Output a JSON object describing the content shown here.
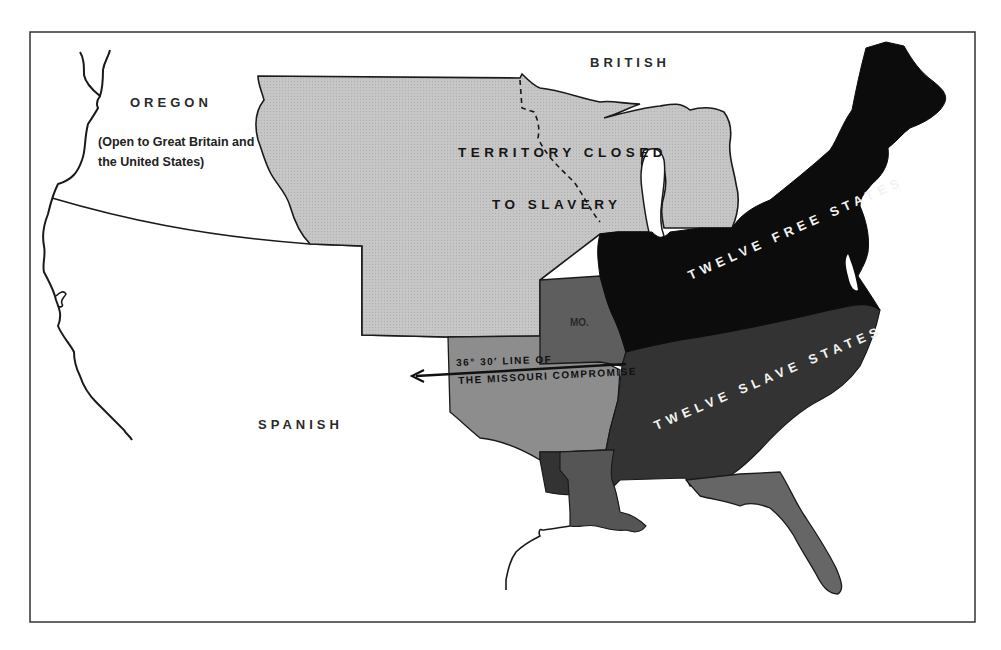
{
  "map": {
    "title": "Missouri Compromise map",
    "frame": {
      "x": 30,
      "y": 32,
      "width": 945,
      "height": 590
    },
    "colors": {
      "background": "#ffffff",
      "outline": "#1a1a1a",
      "closed_territory": "#c4c4c4",
      "missouri_and_slave_territory": "#6e6e6e",
      "slave_states": "#3a3a3a",
      "free_states": "#0c0c0c",
      "florida": "#6a6a6a"
    },
    "labels": {
      "british": "BRITISH",
      "oregon": "OREGON",
      "oregon_note": "(Open to Great Britain and the United States)",
      "spanish": "SPANISH",
      "territory_closed_line1": "TERRITORY CLOSED",
      "territory_closed_line2": "TO SLAVERY",
      "missouri": "MO.",
      "compromise_line1": "36° 30′ LINE OF",
      "compromise_line2": "THE MISSOURI COMPROMISE",
      "free_states": "TWELVE FREE STATES",
      "slave_states": "TWELVE SLAVE STATES"
    },
    "regions": [
      {
        "name": "Oregon Country",
        "status": "Open to Great Britain and the United States"
      },
      {
        "name": "Territory closed to slavery",
        "status": "closed"
      },
      {
        "name": "Missouri",
        "status": "slave state"
      },
      {
        "name": "Twelve free states",
        "count": 12
      },
      {
        "name": "Twelve slave states",
        "count": 12
      },
      {
        "name": "Spanish territory",
        "status": "foreign"
      },
      {
        "name": "British territory",
        "status": "foreign"
      }
    ],
    "compromise_line": {
      "latitude": "36° 30′",
      "arrow_direction": "west"
    }
  }
}
